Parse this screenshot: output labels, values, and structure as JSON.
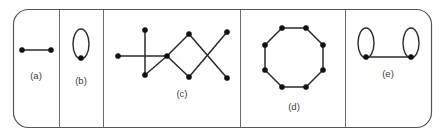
{
  "figure": {
    "width": 444,
    "height": 136,
    "background_color": "#ffffff",
    "frame": {
      "x": 13,
      "y": 9,
      "width": 418,
      "height": 118,
      "corner_radius": 15,
      "stroke_color": "#555555"
    },
    "divider_color": "#6d6d6d",
    "edge_color": "#2b2b2b",
    "vertex_color": "#111111",
    "label_color": "#3a3a3a",
    "dividers_x": [
      59,
      103,
      240,
      345
    ]
  },
  "panels": [
    {
      "id": "panel-a",
      "label": "(a)",
      "label_x": 36,
      "label_y": 79,
      "description": "single edge with two vertices",
      "vertices": [
        {
          "x": 22,
          "y": 50
        },
        {
          "x": 51,
          "y": 50
        }
      ],
      "edges": [
        {
          "x1": 22,
          "y1": 50,
          "x2": 51,
          "y2": 50
        }
      ],
      "loops": []
    },
    {
      "id": "panel-b",
      "label": "(b)",
      "label_x": 81,
      "label_y": 84,
      "description": "single vertex with one self-loop",
      "vertices": [
        {
          "x": 81,
          "y": 58
        }
      ],
      "edges": [],
      "loops": [
        {
          "cx": 81,
          "cy": 44,
          "rx": 8,
          "ry": 15
        }
      ]
    },
    {
      "id": "panel-c",
      "label": "(c)",
      "label_x": 182,
      "label_y": 97,
      "description": "connected graph: a cross, a diamond cycle and an X of crossing edges",
      "vertices": [
        {
          "x": 118,
          "y": 56
        },
        {
          "x": 145,
          "y": 30
        },
        {
          "x": 145,
          "y": 75
        },
        {
          "x": 167,
          "y": 56
        },
        {
          "x": 189,
          "y": 34
        },
        {
          "x": 189,
          "y": 77
        },
        {
          "x": 227,
          "y": 32
        },
        {
          "x": 227,
          "y": 78
        }
      ],
      "edges": [
        {
          "x1": 118,
          "y1": 56,
          "x2": 167,
          "y2": 56
        },
        {
          "x1": 145,
          "y1": 30,
          "x2": 145,
          "y2": 75
        },
        {
          "x1": 145,
          "y1": 75,
          "x2": 167,
          "y2": 56
        },
        {
          "x1": 167,
          "y1": 56,
          "x2": 189,
          "y2": 34
        },
        {
          "x1": 167,
          "y1": 56,
          "x2": 189,
          "y2": 77
        },
        {
          "x1": 189,
          "y1": 34,
          "x2": 227,
          "y2": 78
        },
        {
          "x1": 189,
          "y1": 77,
          "x2": 227,
          "y2": 32
        }
      ],
      "loops": []
    },
    {
      "id": "panel-d",
      "label": "(d)",
      "label_x": 294,
      "label_y": 110,
      "description": "regular octagon cycle with eight vertices",
      "vertices": [
        {
          "x": 282,
          "y": 28
        },
        {
          "x": 306,
          "y": 28
        },
        {
          "x": 323,
          "y": 45
        },
        {
          "x": 323,
          "y": 70
        },
        {
          "x": 306,
          "y": 87
        },
        {
          "x": 282,
          "y": 87
        },
        {
          "x": 265,
          "y": 70
        },
        {
          "x": 265,
          "y": 45
        }
      ],
      "edges": [
        {
          "x1": 282,
          "y1": 28,
          "x2": 306,
          "y2": 28
        },
        {
          "x1": 306,
          "y1": 28,
          "x2": 323,
          "y2": 45
        },
        {
          "x1": 323,
          "y1": 45,
          "x2": 323,
          "y2": 70
        },
        {
          "x1": 323,
          "y1": 70,
          "x2": 306,
          "y2": 87
        },
        {
          "x1": 306,
          "y1": 87,
          "x2": 282,
          "y2": 87
        },
        {
          "x1": 282,
          "y1": 87,
          "x2": 265,
          "y2": 70
        },
        {
          "x1": 265,
          "y1": 70,
          "x2": 265,
          "y2": 45
        },
        {
          "x1": 265,
          "y1": 45,
          "x2": 282,
          "y2": 28
        }
      ],
      "loops": []
    },
    {
      "id": "panel-e",
      "label": "(e)",
      "label_x": 388,
      "label_y": 77,
      "description": "two vertices joined by an edge, each carrying a self-loop",
      "vertices": [
        {
          "x": 366,
          "y": 57
        },
        {
          "x": 411,
          "y": 57
        }
      ],
      "edges": [
        {
          "x1": 366,
          "y1": 57,
          "x2": 411,
          "y2": 57
        }
      ],
      "loops": [
        {
          "cx": 366,
          "cy": 43,
          "rx": 8,
          "ry": 15
        },
        {
          "cx": 411,
          "cy": 43,
          "rx": 8,
          "ry": 15
        }
      ]
    }
  ]
}
